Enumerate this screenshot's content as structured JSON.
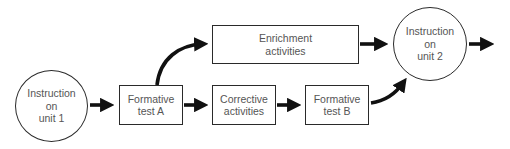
{
  "diagram": {
    "type": "flowchart",
    "nodes": {
      "instruction_unit1": {
        "lines": [
          "Instruction",
          "on",
          "unit 1"
        ],
        "shape": "circle"
      },
      "formative_a": {
        "lines": [
          "Formative",
          "test A"
        ],
        "shape": "box"
      },
      "enrichment": {
        "lines": [
          "Enrichment",
          "activities"
        ],
        "shape": "box"
      },
      "corrective": {
        "lines": [
          "Corrective",
          "activities"
        ],
        "shape": "box"
      },
      "formative_b": {
        "lines": [
          "Formative",
          "test B"
        ],
        "shape": "box"
      },
      "instruction_unit2": {
        "lines": [
          "Instruction",
          "on",
          "unit 2"
        ],
        "shape": "circle"
      }
    },
    "edges": [
      {
        "from": "instruction_unit1",
        "to": "formative_a",
        "style": "straight"
      },
      {
        "from": "formative_a",
        "to": "enrichment",
        "style": "curved"
      },
      {
        "from": "formative_a",
        "to": "corrective",
        "style": "straight"
      },
      {
        "from": "corrective",
        "to": "formative_b",
        "style": "straight"
      },
      {
        "from": "enrichment",
        "to": "instruction_unit2",
        "style": "straight"
      },
      {
        "from": "formative_b",
        "to": "instruction_unit2",
        "style": "curved"
      },
      {
        "from": "instruction_unit2",
        "to": "next",
        "style": "straight"
      }
    ],
    "colors": {
      "stroke": "#111111",
      "border": "#2a2a2a",
      "text": "#555555",
      "background": "#ffffff"
    }
  }
}
